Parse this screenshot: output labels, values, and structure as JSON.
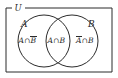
{
  "figure": {
    "type": "venn-diagram",
    "background_color": "#ffffff",
    "stroke_color": "#2b2b2b",
    "text_color": "#2b2b2b"
  },
  "universe": {
    "label": "U",
    "shape": "rectangle"
  },
  "sets": [
    {
      "id": "a",
      "label": "A",
      "shape": "circle"
    },
    {
      "id": "b",
      "label": "B",
      "shape": "circle"
    }
  ],
  "regions": [
    {
      "id": "a-only",
      "label_plain": "A∩B̄",
      "left_operand": "A",
      "operator": "∩",
      "right_operand": "B",
      "right_operand_complement": true
    },
    {
      "id": "a-and-b",
      "label_plain": "A∩B",
      "left_operand": "A",
      "operator": "∩",
      "right_operand": "B",
      "right_operand_complement": false
    },
    {
      "id": "b-only",
      "label_plain": "Ā∩B",
      "left_operand": "A",
      "operator": "∩",
      "right_operand": "B",
      "left_operand_complement": true
    }
  ],
  "geometry": {
    "rect": {
      "x": 6,
      "y": 8,
      "width": 106,
      "height": 64
    },
    "circle_a": {
      "cx": 44,
      "cy": 41,
      "r": 26
    },
    "circle_b": {
      "cx": 72,
      "cy": 41,
      "r": 26
    }
  }
}
